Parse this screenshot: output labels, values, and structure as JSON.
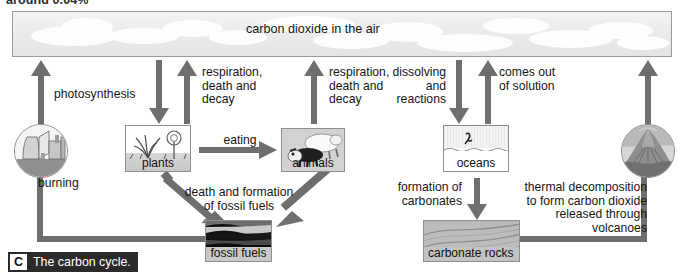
{
  "figure": {
    "clipped_heading": "around 0.04%",
    "caption_letter": "C",
    "caption_text": "The carbon cycle."
  },
  "atmosphere": {
    "label": "carbon dioxide in the air"
  },
  "stores": [
    {
      "id": "plants",
      "label": "plants"
    },
    {
      "id": "animals",
      "label": "animals"
    },
    {
      "id": "oceans",
      "label": "oceans"
    },
    {
      "id": "fossil",
      "label": "fossil fuels"
    },
    {
      "id": "carbonate",
      "label": "carbonate rocks"
    }
  ],
  "icons": [
    {
      "id": "factory",
      "label": "power-station"
    },
    {
      "id": "volcano",
      "label": "volcano"
    }
  ],
  "processes": {
    "photosynthesis": "photosynthesis",
    "respiration_plants": "respiration,\ndeath and\ndecay",
    "respiration_animals": "respiration,\ndeath and\ndecay",
    "eating": "eating",
    "burning": "burning",
    "death_fossil": "death and formation\nof fossil fuels",
    "dissolving": "dissolving\nand\nreactions",
    "comes_out": "comes out\nof solution",
    "formation_carbonates": "formation of\ncarbonates",
    "thermal_decomposition": "thermal decomposition\nto form carbon dioxide\nreleased through\nvolcanoes"
  },
  "colors": {
    "arrow": "#6e6e6e",
    "banner_border": "#9a9a9a",
    "caption_bar": "#2a2a2a",
    "box_border": "#8e8e8e",
    "page_background": "#ffffff"
  }
}
